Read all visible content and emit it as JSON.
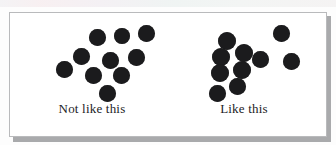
{
  "figure": {
    "background_color": "#ffffff",
    "card_border_color": "#b9babc",
    "shadow_color": "#a9aaac",
    "dot_color": "#1b1b1d"
  },
  "panels": [
    {
      "id": "not-like-this",
      "caption": "Not like this",
      "description": "Evenly spaced dots with regular separation",
      "dot_count": 11,
      "dot_radius": 8.5,
      "dots": [
        {
          "cx": 79,
          "cy": 24,
          "r": 8.5
        },
        {
          "cx": 104,
          "cy": 23,
          "r": 8.0
        },
        {
          "cx": 128,
          "cy": 20,
          "r": 8.5
        },
        {
          "cx": 63,
          "cy": 43,
          "r": 8.5
        },
        {
          "cx": 92,
          "cy": 47,
          "r": 8.5
        },
        {
          "cx": 118,
          "cy": 44,
          "r": 8.5
        },
        {
          "cx": 46,
          "cy": 56,
          "r": 8.5
        },
        {
          "cx": 75,
          "cy": 62,
          "r": 8.5
        },
        {
          "cx": 103,
          "cy": 62,
          "r": 8.5
        },
        {
          "cx": 89,
          "cy": 80,
          "r": 8.5
        }
      ]
    },
    {
      "id": "like-this",
      "caption": "Like this",
      "description": "Clumped dots touching in a dense cluster with separate outliers",
      "dot_count": 11,
      "dot_radius": 8.5,
      "dots": [
        {
          "cx": 57,
          "cy": 28,
          "r": 9.0
        },
        {
          "cx": 74,
          "cy": 40,
          "r": 9.0
        },
        {
          "cx": 51,
          "cy": 44,
          "r": 9.0
        },
        {
          "cx": 72,
          "cy": 57,
          "r": 9.0
        },
        {
          "cx": 50,
          "cy": 60,
          "r": 9.0
        },
        {
          "cx": 90,
          "cy": 46,
          "r": 8.5
        },
        {
          "cx": 67,
          "cy": 73,
          "r": 8.5
        },
        {
          "cx": 47,
          "cy": 80,
          "r": 8.5
        },
        {
          "cx": 111,
          "cy": 20,
          "r": 8.5
        },
        {
          "cx": 121,
          "cy": 48,
          "r": 8.5
        }
      ]
    }
  ]
}
